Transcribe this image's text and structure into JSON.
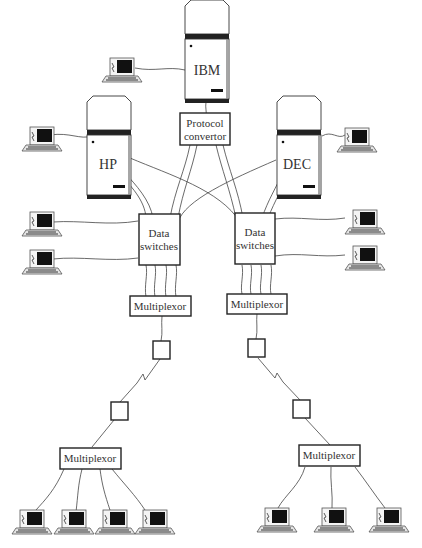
{
  "diagram": {
    "mainframes": [
      {
        "id": "ibm",
        "label": "IBM"
      },
      {
        "id": "hp",
        "label": "HP"
      },
      {
        "id": "dec",
        "label": "DEC"
      }
    ],
    "protocol_convertor": {
      "line1": "Protocol",
      "line2": "convertor"
    },
    "data_switches": [
      {
        "id": "left",
        "line1": "Data",
        "line2": "switches"
      },
      {
        "id": "right",
        "line1": "Data",
        "line2": "switches"
      }
    ],
    "multiplexors": [
      {
        "id": "left-upper",
        "label": "Multiplexor"
      },
      {
        "id": "right-upper",
        "label": "Multiplexor"
      },
      {
        "id": "left-lower",
        "label": "Multiplexor"
      },
      {
        "id": "right-lower",
        "label": "Multiplexor"
      }
    ],
    "modems": [
      "left-top",
      "right-top",
      "left-bottom",
      "right-bottom"
    ],
    "terminal_count": 14
  }
}
